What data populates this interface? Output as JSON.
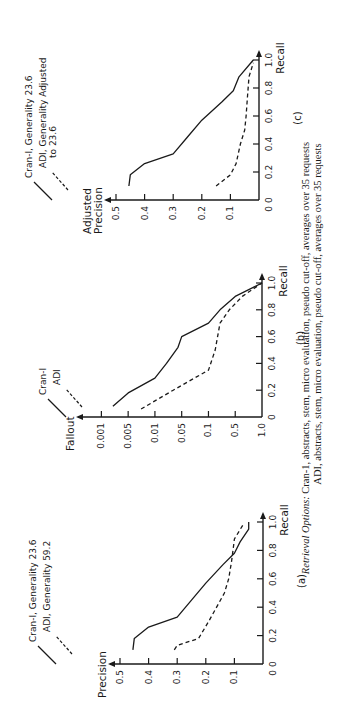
{
  "figure": {
    "caption": {
      "prefix": "Retrieval Options:",
      "line1": "Cran-1, abstracts, stem, micro evaluation, pseudo cut-off, averages over 35 requests",
      "line2": "ADI, abstracts, stem, micro evaluation, pseudo cut-off, averages over 35 requests"
    },
    "orientation": "rotated 90° counter-clockwise"
  },
  "chart_data": [
    {
      "panel": "(a)",
      "type": "line",
      "title": "",
      "xlabel": "Recall",
      "ylabel": "Precision",
      "xlim": [
        0,
        1.0
      ],
      "ylim": [
        0,
        0.5
      ],
      "xticks": [
        "0",
        "0.2",
        "0.4",
        "0.6",
        "0.8",
        "1.0"
      ],
      "yticks": [
        "0.1",
        "0.2",
        "0.3",
        "0.4",
        "0.5"
      ],
      "origin_label": "0",
      "grid": false,
      "legend": [
        {
          "label": "Cran-I, Generality 23.6",
          "style": "solid"
        },
        {
          "label": "ADI, Generality 59.2",
          "style": "dashed"
        }
      ],
      "series": [
        {
          "name": "Cran-I, Generality 23.6",
          "style": "solid",
          "x": [
            0.1,
            0.18,
            0.26,
            0.33,
            0.45,
            0.57,
            0.7,
            0.78,
            0.86,
            0.95,
            1.0
          ],
          "y": [
            0.455,
            0.45,
            0.4,
            0.3,
            0.25,
            0.2,
            0.14,
            0.1,
            0.08,
            0.05,
            0.05
          ]
        },
        {
          "name": "ADI, Generality 59.2",
          "style": "dashed",
          "x": [
            0.1,
            0.13,
            0.18,
            0.3,
            0.5,
            0.6,
            0.72,
            0.8,
            0.88,
            0.98
          ],
          "y": [
            0.31,
            0.3,
            0.225,
            0.19,
            0.135,
            0.12,
            0.11,
            0.105,
            0.1,
            0.07
          ]
        }
      ]
    },
    {
      "panel": "(b)",
      "type": "line",
      "title": "",
      "xlabel": "Recall",
      "ylabel": "Fallout",
      "xlim": [
        0,
        1.0
      ],
      "yscale": "log (inverted)",
      "xticks": [
        "0",
        "0.2",
        "0.4",
        "0.6",
        "0.8",
        "1.0"
      ],
      "yticks": [
        "1.0",
        "0.5",
        "0.1",
        "0.05",
        "0.01",
        "0.005",
        "0.001"
      ],
      "grid": false,
      "legend": [
        {
          "label": "Cran-I",
          "style": "solid"
        },
        {
          "label": "ADI",
          "style": "dashed"
        }
      ],
      "series": [
        {
          "name": "Cran-I",
          "style": "solid",
          "x": [
            0.08,
            0.18,
            0.29,
            0.4,
            0.52,
            0.6,
            0.7,
            0.8,
            0.9,
            1.0
          ],
          "y": [
            0.002,
            0.005,
            0.01,
            0.02,
            0.04,
            0.05,
            0.1,
            0.2,
            0.5,
            1.0
          ]
        },
        {
          "name": "ADI",
          "style": "dashed",
          "x": [
            0.06,
            0.2,
            0.35,
            0.5,
            0.7,
            0.8,
            0.9,
            1.0
          ],
          "y": [
            0.007,
            0.03,
            0.1,
            0.15,
            0.2,
            0.35,
            0.6,
            1.0
          ]
        }
      ]
    },
    {
      "panel": "(c)",
      "type": "line",
      "title": "",
      "xlabel": "Recall",
      "ylabel": "Adjusted Precision",
      "xlim": [
        0,
        1.0
      ],
      "ylim": [
        0,
        0.5
      ],
      "xticks": [
        "0",
        "0.2",
        "0.4",
        "0.6",
        "0.8",
        "1.0"
      ],
      "yticks": [
        "0.1",
        "0.2",
        "0.3",
        "0.4",
        "0.5"
      ],
      "origin_label": "0",
      "grid": false,
      "legend": [
        {
          "label": "Cran-I, Generality 23.6",
          "style": "solid"
        },
        {
          "label": "ADI, Generality Adjusted to 23.6",
          "style": "dashed"
        }
      ],
      "series": [
        {
          "name": "Cran-I, Generality 23.6",
          "style": "solid",
          "x": [
            0.1,
            0.18,
            0.26,
            0.33,
            0.45,
            0.57,
            0.7,
            0.78,
            0.88,
            1.0
          ],
          "y": [
            0.455,
            0.45,
            0.4,
            0.3,
            0.25,
            0.2,
            0.13,
            0.09,
            0.07,
            0.02
          ]
        },
        {
          "name": "ADI, Generality Adjusted to 23.6",
          "style": "dashed",
          "x": [
            0.1,
            0.18,
            0.26,
            0.4,
            0.5,
            0.6,
            0.75,
            0.88,
            0.98
          ],
          "y": [
            0.15,
            0.1,
            0.08,
            0.065,
            0.05,
            0.045,
            0.04,
            0.035,
            0.02
          ]
        }
      ]
    }
  ],
  "panels": {
    "a": {
      "label": "(a)",
      "ylabel": "Precision",
      "xlabel": "Recall",
      "legend1": "Cran-I, Generality 23.6",
      "legend2": "ADI, Generality 59.2"
    },
    "b": {
      "label": "(b)",
      "ylabel": "Fallout",
      "xlabel": "Recall",
      "legend1": "Cran-I",
      "legend2": "ADI"
    },
    "c": {
      "label": "(c)",
      "ylabel1": "Adjusted",
      "ylabel2": "Precision",
      "xlabel": "Recall",
      "legend1": "Cran-I, Generality 23.6",
      "legend2a": "ADI, Generality Adjusted",
      "legend2b": "to 23.6"
    }
  },
  "colors": {
    "ink": "#1a1a1a",
    "background": "#ffffff"
  }
}
